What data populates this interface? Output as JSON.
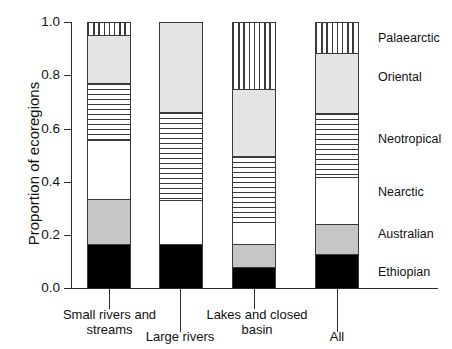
{
  "chart_data": {
    "type": "bar",
    "subtype": "stacked-proportional",
    "title": "",
    "xlabel": "",
    "ylabel": "Proportion of ecoregions",
    "ylim": [
      0.0,
      1.0
    ],
    "ytick_labels": [
      "1.0",
      "0.8",
      "0.6",
      "0.4",
      "0.2",
      "0.0"
    ],
    "ytick_values": [
      1.0,
      0.8,
      0.6,
      0.4,
      0.2,
      0.0
    ],
    "grid": false,
    "legend_position": "right",
    "categories": [
      "Small rivers and\nstreams",
      "Large rivers",
      "Lakes and closed\nbasin",
      "All"
    ],
    "series": [
      {
        "name": "Ethiopian",
        "fill": "solid-black",
        "color": "#000000",
        "values": [
          0.165,
          0.165,
          0.08,
          0.13
        ]
      },
      {
        "name": "Australian",
        "fill": "gray",
        "color": "#c6c6c6",
        "values": [
          0.17,
          0.0,
          0.085,
          0.11
        ]
      },
      {
        "name": "Nearctic",
        "fill": "white",
        "color": "#ffffff",
        "values": [
          0.225,
          0.168,
          0.085,
          0.18
        ]
      },
      {
        "name": "Neotropical",
        "fill": "horizontal-stripe",
        "color": "#3a3a3a",
        "values": [
          0.215,
          0.332,
          0.25,
          0.24
        ]
      },
      {
        "name": "Oriental",
        "fill": "light-gray",
        "color": "#e4e4e4",
        "values": [
          0.18,
          0.335,
          0.25,
          0.225
        ]
      },
      {
        "name": "Palaearctic",
        "fill": "vertical-stripe",
        "color": "#3a3a3a",
        "values": [
          0.045,
          0.0,
          0.25,
          0.115
        ]
      }
    ],
    "legend_entries": [
      "Palaearctic",
      "Oriental",
      "Neotropical",
      "Nearctic",
      "Australian",
      "Ethiopian"
    ]
  }
}
